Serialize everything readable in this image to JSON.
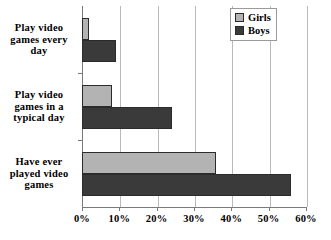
{
  "chart_data": {
    "type": "bar",
    "orientation": "horizontal",
    "title": "",
    "subtitle": "",
    "xlabel": "",
    "ylabel": "",
    "categories": [
      "Play video games every day",
      "Play video games in a typical day",
      "Have ever played video games"
    ],
    "series": [
      {
        "name": "Girls",
        "color": "#b3b3b3",
        "values": [
          2,
          8,
          36
        ]
      },
      {
        "name": "Boys",
        "color": "#3a3a3a",
        "values": [
          9,
          24,
          56
        ]
      }
    ],
    "xlim": [
      0,
      60
    ],
    "xticks": [
      0,
      10,
      20,
      30,
      40,
      50,
      60
    ],
    "xtick_labels": [
      "0%",
      "10%",
      "20%",
      "30%",
      "40%",
      "50%",
      "60%"
    ],
    "grid": true,
    "grid_axis": "x",
    "legend_position": "top-right",
    "value_suffix": "%"
  },
  "legend": {
    "entries": [
      {
        "label": "Girls"
      },
      {
        "label": "Boys"
      }
    ]
  },
  "axis": {
    "category_labels": [
      {
        "lines": [
          "Play video",
          "games every",
          "day"
        ]
      },
      {
        "lines": [
          "Play video",
          "games in a",
          "typical day"
        ]
      },
      {
        "lines": [
          "Have ever",
          "played video",
          "games"
        ]
      }
    ]
  }
}
